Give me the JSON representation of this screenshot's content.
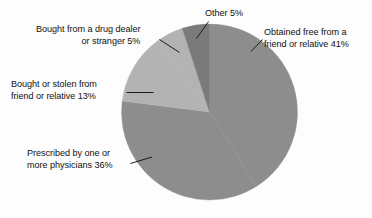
{
  "chart_data": {
    "type": "pie",
    "title": "",
    "subtitle": "",
    "xlabel": "",
    "ylabel": "",
    "legend_position": "none",
    "grid": false,
    "units": "percent",
    "total": 100,
    "categories": [
      "Obtained free from a friend or relative",
      "Prescribed by one or more physicians",
      "Bought or stolen from friend or relative",
      "Bought from a drug dealer or stranger",
      "Other"
    ],
    "values": [
      41,
      36,
      13,
      5,
      5
    ],
    "slices": [
      {
        "id": "obtained-free",
        "label_line1": "Obtained free from a",
        "label_line2": "friend or relative 41%",
        "value": 41,
        "value_text": "41%",
        "color": "#8d8d8d",
        "start_deg": 0,
        "end_deg": 147.6
      },
      {
        "id": "prescribed",
        "label_line1": "Prescribed by one or",
        "label_line2": "more physicians 36%",
        "value": 36,
        "value_text": "36%",
        "color": "#8d8d8d",
        "start_deg": 147.6,
        "end_deg": 277.2
      },
      {
        "id": "bought-or-stolen",
        "label_line1": "Bought or stolen from",
        "label_line2": "friend or relative 13%",
        "value": 13,
        "value_text": "13%",
        "color": "#b3b3b3",
        "start_deg": 277.2,
        "end_deg": 324.0
      },
      {
        "id": "drug-dealer",
        "label_line1": "Bought from a drug dealer",
        "label_line2": "or stranger 5%",
        "value": 5,
        "value_text": "5%",
        "color": "#b3b3b3",
        "start_deg": 324.0,
        "end_deg": 342.0
      },
      {
        "id": "other",
        "label_line1": "Other 5%",
        "label_line2": "",
        "value": 5,
        "value_text": "5%",
        "color": "#7a7a7a",
        "start_deg": 342.0,
        "end_deg": 360.0
      }
    ],
    "background_color": "#fdfdfd",
    "text_color": "#111111",
    "leader_line_color": "#1a1a1a"
  }
}
